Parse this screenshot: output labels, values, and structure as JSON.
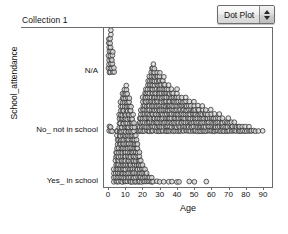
{
  "window": {
    "collection_title": "Collection 1"
  },
  "plot_type_menu": {
    "selected": "Dot Plot",
    "options": [
      "Dot Plot",
      "Histogram",
      "Box Plot",
      "Scatter Plot"
    ],
    "stepper_up_icon": "triangle-up-icon",
    "stepper_down_icon": "triangle-down-icon"
  },
  "chart_data": {
    "type": "scatter",
    "subtype": "dot-plot",
    "title": "",
    "xlabel": "Age",
    "ylabel": "School_attendance",
    "xlim": [
      0,
      90
    ],
    "x_ticks": [
      0,
      10,
      20,
      30,
      40,
      50,
      60,
      70,
      80,
      90
    ],
    "x_tick_labels": [
      "0",
      "10",
      "20",
      "30",
      "40",
      "50",
      "60",
      "70",
      "80",
      "90"
    ],
    "grid": false,
    "legend": false,
    "marker": {
      "shape": "circle",
      "fill": "#d8d8d8",
      "stroke": "#333333",
      "radius_px": 2.4
    },
    "categories": [
      "N/A",
      "No_ not in school",
      "Yes_ in school"
    ],
    "category_order_top_to_bottom": [
      "N/A",
      "No_ not in school",
      "Yes_ in school"
    ],
    "series": [
      {
        "name": "N/A",
        "description": "Tight vertical stack of infants aged 0-2",
        "bins": [
          {
            "age": 0,
            "count": 9
          },
          {
            "age": 1,
            "count": 11
          },
          {
            "age": 2,
            "count": 6
          },
          {
            "age": 3,
            "count": 2
          }
        ]
      },
      {
        "name": "No_ not in school",
        "description": "Broad dense band from about 20 to 90 peaking near 25-32, with a few points near 0-6",
        "bins": [
          {
            "age": 0,
            "count": 2
          },
          {
            "age": 1,
            "count": 2
          },
          {
            "age": 2,
            "count": 1
          },
          {
            "age": 5,
            "count": 1
          },
          {
            "age": 6,
            "count": 1
          },
          {
            "age": 16,
            "count": 1
          },
          {
            "age": 17,
            "count": 2
          },
          {
            "age": 18,
            "count": 4
          },
          {
            "age": 19,
            "count": 6
          },
          {
            "age": 20,
            "count": 9
          },
          {
            "age": 21,
            "count": 10
          },
          {
            "age": 22,
            "count": 11
          },
          {
            "age": 23,
            "count": 13
          },
          {
            "age": 24,
            "count": 14
          },
          {
            "age": 25,
            "count": 16
          },
          {
            "age": 26,
            "count": 17
          },
          {
            "age": 27,
            "count": 16
          },
          {
            "age": 28,
            "count": 15
          },
          {
            "age": 29,
            "count": 14
          },
          {
            "age": 30,
            "count": 15
          },
          {
            "age": 31,
            "count": 13
          },
          {
            "age": 32,
            "count": 14
          },
          {
            "age": 33,
            "count": 12
          },
          {
            "age": 34,
            "count": 11
          },
          {
            "age": 35,
            "count": 12
          },
          {
            "age": 36,
            "count": 10
          },
          {
            "age": 37,
            "count": 11
          },
          {
            "age": 38,
            "count": 10
          },
          {
            "age": 39,
            "count": 9
          },
          {
            "age": 40,
            "count": 11
          },
          {
            "age": 41,
            "count": 9
          },
          {
            "age": 42,
            "count": 8
          },
          {
            "age": 43,
            "count": 9
          },
          {
            "age": 44,
            "count": 8
          },
          {
            "age": 45,
            "count": 9
          },
          {
            "age": 46,
            "count": 7
          },
          {
            "age": 47,
            "count": 8
          },
          {
            "age": 48,
            "count": 7
          },
          {
            "age": 49,
            "count": 6
          },
          {
            "age": 50,
            "count": 8
          },
          {
            "age": 51,
            "count": 6
          },
          {
            "age": 52,
            "count": 7
          },
          {
            "age": 53,
            "count": 6
          },
          {
            "age": 54,
            "count": 5
          },
          {
            "age": 55,
            "count": 7
          },
          {
            "age": 56,
            "count": 5
          },
          {
            "age": 57,
            "count": 6
          },
          {
            "age": 58,
            "count": 5
          },
          {
            "age": 59,
            "count": 4
          },
          {
            "age": 60,
            "count": 6
          },
          {
            "age": 61,
            "count": 4
          },
          {
            "age": 62,
            "count": 5
          },
          {
            "age": 63,
            "count": 4
          },
          {
            "age": 64,
            "count": 4
          },
          {
            "age": 65,
            "count": 5
          },
          {
            "age": 66,
            "count": 3
          },
          {
            "age": 67,
            "count": 4
          },
          {
            "age": 68,
            "count": 3
          },
          {
            "age": 69,
            "count": 3
          },
          {
            "age": 70,
            "count": 4
          },
          {
            "age": 71,
            "count": 3
          },
          {
            "age": 72,
            "count": 3
          },
          {
            "age": 73,
            "count": 2
          },
          {
            "age": 74,
            "count": 3
          },
          {
            "age": 75,
            "count": 2
          },
          {
            "age": 76,
            "count": 2
          },
          {
            "age": 77,
            "count": 2
          },
          {
            "age": 78,
            "count": 2
          },
          {
            "age": 79,
            "count": 1
          },
          {
            "age": 80,
            "count": 2
          },
          {
            "age": 81,
            "count": 1
          },
          {
            "age": 82,
            "count": 2
          },
          {
            "age": 83,
            "count": 1
          },
          {
            "age": 84,
            "count": 1
          },
          {
            "age": 85,
            "count": 1
          },
          {
            "age": 86,
            "count": 1
          },
          {
            "age": 88,
            "count": 1
          },
          {
            "age": 90,
            "count": 1
          }
        ]
      },
      {
        "name": "Yes_ in school",
        "description": "Dense triangular cluster from 3 to 22 peaking near 8-12, thin tail of outliers out to about 57",
        "bins": [
          {
            "age": 3,
            "count": 4
          },
          {
            "age": 4,
            "count": 8
          },
          {
            "age": 5,
            "count": 13
          },
          {
            "age": 6,
            "count": 17
          },
          {
            "age": 7,
            "count": 20
          },
          {
            "age": 8,
            "count": 22
          },
          {
            "age": 9,
            "count": 23
          },
          {
            "age": 10,
            "count": 24
          },
          {
            "age": 11,
            "count": 22
          },
          {
            "age": 12,
            "count": 21
          },
          {
            "age": 13,
            "count": 19
          },
          {
            "age": 14,
            "count": 17
          },
          {
            "age": 15,
            "count": 15
          },
          {
            "age": 16,
            "count": 12
          },
          {
            "age": 17,
            "count": 10
          },
          {
            "age": 18,
            "count": 8
          },
          {
            "age": 19,
            "count": 6
          },
          {
            "age": 20,
            "count": 5
          },
          {
            "age": 21,
            "count": 4
          },
          {
            "age": 22,
            "count": 3
          },
          {
            "age": 23,
            "count": 2
          },
          {
            "age": 24,
            "count": 2
          },
          {
            "age": 25,
            "count": 2
          },
          {
            "age": 26,
            "count": 1
          },
          {
            "age": 28,
            "count": 1
          },
          {
            "age": 30,
            "count": 1
          },
          {
            "age": 32,
            "count": 1
          },
          {
            "age": 35,
            "count": 1
          },
          {
            "age": 37,
            "count": 1
          },
          {
            "age": 40,
            "count": 1
          },
          {
            "age": 41,
            "count": 1
          },
          {
            "age": 47,
            "count": 1
          },
          {
            "age": 50,
            "count": 1
          },
          {
            "age": 57,
            "count": 1
          }
        ]
      }
    ]
  }
}
